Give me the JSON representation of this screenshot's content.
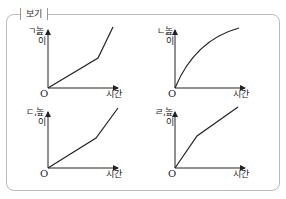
{
  "header": {
    "partial_text": "...",
    "box_title": "보기"
  },
  "graphs": [
    {
      "id": "ㄱ",
      "label": "ㄱ,",
      "ylabel": "높이",
      "xlabel": "시간",
      "origin": "O",
      "shape": "linear-then-steeper"
    },
    {
      "id": "ㄴ",
      "label": "ㄴ,",
      "ylabel": "높이",
      "xlabel": "시간",
      "origin": "O",
      "shape": "concave-increasing"
    },
    {
      "id": "ㄷ",
      "label": "ㄷ,",
      "ylabel": "높이",
      "xlabel": "시간",
      "origin": "O",
      "shape": "linear-then-steeper"
    },
    {
      "id": "ㄹ",
      "label": "ㄹ,",
      "ylabel": "높이",
      "xlabel": "시간",
      "origin": "O",
      "shape": "steep-then-shallower"
    }
  ]
}
